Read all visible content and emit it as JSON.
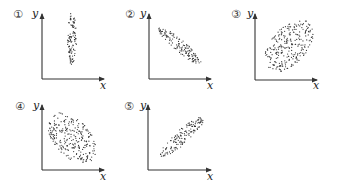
{
  "chart_data": [
    {
      "type": "scatter",
      "label": "①",
      "title": "",
      "xlabel": "x",
      "ylabel": "y",
      "description": "vertical narrow cloud, no correlation",
      "correlation": 0,
      "origin": [
        42,
        79
      ],
      "x_end": 104,
      "y_top": 14,
      "cloud": {
        "cx": 72,
        "cy": 39,
        "rx": 4.5,
        "ry": 27,
        "angle": 0,
        "n": 110
      }
    },
    {
      "type": "scatter",
      "label": "②",
      "title": "",
      "xlabel": "x",
      "ylabel": "y",
      "description": "narrow cloud sloping downward, strong negative correlation",
      "correlation": -0.9,
      "origin": [
        149,
        79
      ],
      "x_end": 211,
      "y_top": 14,
      "cloud": {
        "cx": 180,
        "cy": 46,
        "rx": 28,
        "ry": 6,
        "angle": 40,
        "n": 140
      }
    },
    {
      "type": "scatter",
      "label": "③",
      "title": "",
      "xlabel": "x",
      "ylabel": "y",
      "description": "wide cloud sloping upward, moderate positive correlation",
      "correlation": 0.6,
      "origin": [
        255,
        80
      ],
      "x_end": 317,
      "y_top": 14,
      "cloud": {
        "cx": 289,
        "cy": 46,
        "rx": 31,
        "ry": 18,
        "angle": -48,
        "n": 260
      }
    },
    {
      "type": "scatter",
      "label": "④",
      "title": "",
      "xlabel": "x",
      "ylabel": "y",
      "description": "wide cloud sloping downward, moderate negative correlation",
      "correlation": -0.6,
      "origin": [
        42,
        170
      ],
      "x_end": 104,
      "y_top": 105,
      "cloud": {
        "cx": 72,
        "cy": 138,
        "rx": 30,
        "ry": 18,
        "angle": 48,
        "n": 260
      }
    },
    {
      "type": "scatter",
      "label": "⑤",
      "title": "",
      "xlabel": "x",
      "ylabel": "y",
      "description": "narrow cloud sloping upward, strong positive correlation",
      "correlation": 0.9,
      "origin": [
        148,
        170
      ],
      "x_end": 211,
      "y_top": 105,
      "cloud": {
        "cx": 182,
        "cy": 137,
        "rx": 29,
        "ry": 7,
        "angle": -42,
        "n": 150
      }
    }
  ],
  "panels": [
    {
      "label": "①",
      "x": "x",
      "y": "y"
    },
    {
      "label": "②",
      "x": "x",
      "y": "y"
    },
    {
      "label": "③",
      "x": "x",
      "y": "y"
    },
    {
      "label": "④",
      "x": "x",
      "y": "y"
    },
    {
      "label": "⑤",
      "x": "x",
      "y": "y"
    }
  ],
  "style": {
    "axis_color": "#333333",
    "dot_color": "#333333",
    "background": "#ffffff"
  }
}
